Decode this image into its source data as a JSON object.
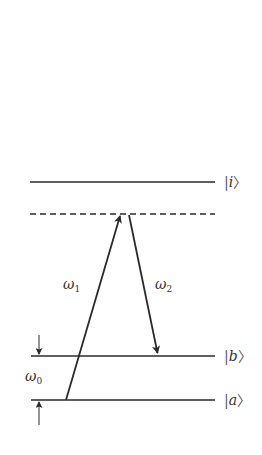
{
  "diagram": {
    "colors": {
      "line": "#2a2a2a",
      "text": "#444444",
      "background": "#ffffff"
    },
    "levels": [
      {
        "id": "i",
        "label_prefix": "|",
        "symbol": "i",
        "label_suffix": "〉",
        "y": 182,
        "x1": 30,
        "x2": 215,
        "style": "solid"
      },
      {
        "id": "virtual",
        "label_prefix": "",
        "symbol": "",
        "label_suffix": "",
        "y": 214,
        "x1": 30,
        "x2": 215,
        "style": "dashed"
      },
      {
        "id": "b",
        "label_prefix": "|",
        "symbol": "b",
        "label_suffix": "〉",
        "y": 356,
        "x1": 31,
        "x2": 215,
        "style": "solid"
      },
      {
        "id": "a",
        "label_prefix": "|",
        "symbol": "a",
        "label_suffix": "〉",
        "y": 400,
        "x1": 31,
        "x2": 215,
        "style": "solid"
      }
    ],
    "transitions": [
      {
        "id": "omega1",
        "label": "ω",
        "subscript": "1",
        "from": [
          66,
          400
        ],
        "to": [
          121,
          214
        ],
        "direction": "up"
      },
      {
        "id": "omega2",
        "label": "ω",
        "subscript": "2",
        "from": [
          129,
          214
        ],
        "to": [
          158,
          356
        ],
        "direction": "down"
      }
    ],
    "splitting": {
      "label": "ω",
      "subscript": "0",
      "between": [
        "a",
        "b"
      ]
    }
  }
}
